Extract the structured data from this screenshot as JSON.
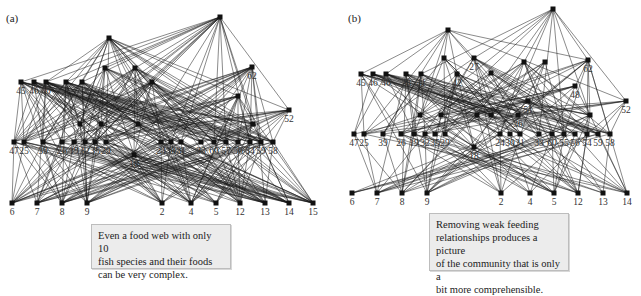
{
  "panels": [
    {
      "id": "a",
      "label": "(a)",
      "caption_lines": [
        "Even a food web with only 10",
        "fish species and their foods",
        "can be very complex."
      ],
      "nodes": {
        "top": [
          {
            "x": 220,
            "y": 17
          },
          {
            "x": 109,
            "y": 38
          }
        ],
        "level2": [
          {
            "x": 21,
            "y": 82,
            "label": "45"
          },
          {
            "x": 34,
            "y": 82,
            "label": "46"
          },
          {
            "x": 46,
            "y": 82,
            "label": "40"
          },
          {
            "x": 66,
            "y": 82,
            "label": ""
          },
          {
            "x": 82,
            "y": 82,
            "label": ""
          },
          {
            "x": 105,
            "y": 68,
            "label": ""
          },
          {
            "x": 135,
            "y": 68,
            "label": ""
          },
          {
            "x": 252,
            "y": 67,
            "label": "62"
          },
          {
            "x": 238,
            "y": 96,
            "label": ""
          },
          {
            "x": 289,
            "y": 110,
            "label": "52"
          },
          {
            "x": 152,
            "y": 82,
            "label": ""
          }
        ],
        "level3": [
          {
            "x": 14,
            "y": 142,
            "label": "47"
          },
          {
            "x": 24,
            "y": 142,
            "label": "25"
          },
          {
            "x": 43,
            "y": 142,
            "label": "39"
          },
          {
            "x": 62,
            "y": 142,
            "label": "26"
          },
          {
            "x": 74,
            "y": 142,
            "label": "19"
          },
          {
            "x": 85,
            "y": 142,
            "label": "32"
          },
          {
            "x": 95,
            "y": 142,
            "label": "35"
          },
          {
            "x": 106,
            "y": 142,
            "label": "29"
          },
          {
            "x": 161,
            "y": 142,
            "label": "24"
          },
          {
            "x": 171,
            "y": 142,
            "label": "30"
          },
          {
            "x": 181,
            "y": 142,
            "label": "31"
          },
          {
            "x": 201,
            "y": 142,
            "label": "33"
          },
          {
            "x": 214,
            "y": 142,
            "label": "60"
          },
          {
            "x": 226,
            "y": 142,
            "label": "57"
          },
          {
            "x": 238,
            "y": 142,
            "label": "56"
          },
          {
            "x": 250,
            "y": 142,
            "label": "54"
          },
          {
            "x": 261,
            "y": 142,
            "label": "59"
          },
          {
            "x": 273,
            "y": 142,
            "label": "58"
          },
          {
            "x": 134,
            "y": 155,
            "label": "18"
          },
          {
            "x": 80,
            "y": 124,
            "label": ""
          },
          {
            "x": 101,
            "y": 124,
            "label": ""
          },
          {
            "x": 138,
            "y": 124,
            "label": ""
          },
          {
            "x": 253,
            "y": 124,
            "label": ""
          }
        ],
        "bottom": [
          {
            "x": 12,
            "y": 203,
            "label": "6"
          },
          {
            "x": 37,
            "y": 203,
            "label": "7"
          },
          {
            "x": 62,
            "y": 203,
            "label": "8"
          },
          {
            "x": 87,
            "y": 203,
            "label": "9"
          },
          {
            "x": 162,
            "y": 203,
            "label": "2"
          },
          {
            "x": 191,
            "y": 203,
            "label": "4"
          },
          {
            "x": 216,
            "y": 203,
            "label": "5"
          },
          {
            "x": 240,
            "y": 203,
            "label": "12"
          },
          {
            "x": 265,
            "y": 203,
            "label": "13"
          },
          {
            "x": 289,
            "y": 203,
            "label": "14"
          },
          {
            "x": 313,
            "y": 203,
            "label": "15"
          }
        ]
      }
    },
    {
      "id": "b",
      "label": "(b)",
      "caption_lines": [
        "Removing weak feeding",
        "relationships produces a picture",
        "of the community that is only a",
        "bit more comprehensible."
      ],
      "nodes": {
        "top": [
          {
            "x": 233,
            "y": 9
          },
          {
            "x": 128,
            "y": 30
          }
        ],
        "level2": [
          {
            "x": 41,
            "y": 74,
            "label": "45"
          },
          {
            "x": 53,
            "y": 74,
            "label": "46"
          },
          {
            "x": 66,
            "y": 74,
            "label": "40"
          },
          {
            "x": 86,
            "y": 74,
            "label": "28"
          },
          {
            "x": 101,
            "y": 74,
            "label": "41"
          },
          {
            "x": 124,
            "y": 58,
            "label": ""
          },
          {
            "x": 154,
            "y": 58,
            "label": "27"
          },
          {
            "x": 268,
            "y": 60,
            "label": "62"
          },
          {
            "x": 255,
            "y": 86,
            "label": "48"
          },
          {
            "x": 306,
            "y": 101,
            "label": "52"
          },
          {
            "x": 137,
            "y": 74,
            "label": "42"
          },
          {
            "x": 171,
            "y": 73,
            "label": ""
          },
          {
            "x": 204,
            "y": 62,
            "label": ""
          },
          {
            "x": 225,
            "y": 62,
            "label": ""
          },
          {
            "x": 208,
            "y": 101,
            "label": "51"
          }
        ],
        "level3": [
          {
            "x": 34,
            "y": 134,
            "label": "47"
          },
          {
            "x": 44,
            "y": 134,
            "label": "25"
          },
          {
            "x": 63,
            "y": 134,
            "label": "39"
          },
          {
            "x": 81,
            "y": 134,
            "label": "26"
          },
          {
            "x": 94,
            "y": 134,
            "label": "19"
          },
          {
            "x": 105,
            "y": 134,
            "label": "32"
          },
          {
            "x": 115,
            "y": 134,
            "label": "35"
          },
          {
            "x": 125,
            "y": 134,
            "label": "29"
          },
          {
            "x": 180,
            "y": 134,
            "label": "24"
          },
          {
            "x": 190,
            "y": 134,
            "label": "30"
          },
          {
            "x": 200,
            "y": 134,
            "label": "31"
          },
          {
            "x": 219,
            "y": 134,
            "label": "33"
          },
          {
            "x": 232,
            "y": 134,
            "label": "60"
          },
          {
            "x": 244,
            "y": 134,
            "label": "55"
          },
          {
            "x": 255,
            "y": 134,
            "label": "56"
          },
          {
            "x": 267,
            "y": 134,
            "label": "54"
          },
          {
            "x": 278,
            "y": 134,
            "label": "59"
          },
          {
            "x": 290,
            "y": 134,
            "label": "58"
          },
          {
            "x": 154,
            "y": 147,
            "label": "18"
          },
          {
            "x": 100,
            "y": 115,
            "label": ""
          },
          {
            "x": 121,
            "y": 115,
            "label": ""
          },
          {
            "x": 157,
            "y": 115,
            "label": ""
          },
          {
            "x": 171,
            "y": 115,
            "label": ""
          },
          {
            "x": 198,
            "y": 115,
            "label": "36"
          },
          {
            "x": 270,
            "y": 115,
            "label": ""
          }
        ],
        "bottom": [
          {
            "x": 32,
            "y": 193,
            "label": "6"
          },
          {
            "x": 57,
            "y": 193,
            "label": "7"
          },
          {
            "x": 82,
            "y": 193,
            "label": "8"
          },
          {
            "x": 107,
            "y": 193,
            "label": "9"
          },
          {
            "x": 181,
            "y": 193,
            "label": "2"
          },
          {
            "x": 210,
            "y": 193,
            "label": "4"
          },
          {
            "x": 234,
            "y": 193,
            "label": "5"
          },
          {
            "x": 258,
            "y": 193,
            "label": "12"
          },
          {
            "x": 283,
            "y": 193,
            "label": "13"
          },
          {
            "x": 307,
            "y": 193,
            "label": "14"
          }
        ]
      }
    }
  ]
}
